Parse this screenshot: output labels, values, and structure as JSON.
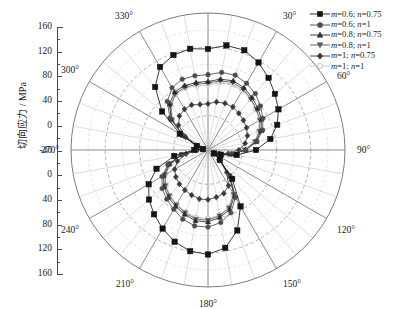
{
  "axis": {
    "y_title": "切向应力 / MPa",
    "y_ticks": [
      "160",
      "120",
      "80",
      "40",
      "0",
      "-40",
      "0",
      "40",
      "80",
      "120",
      "160"
    ]
  },
  "angles": {
    "a0": "0°",
    "a30": "30°",
    "a60": "60°",
    "a90": "90°",
    "a120": "120°",
    "a150": "150°",
    "a180": "180°",
    "a210": "210°",
    "a240": "240°",
    "a270": "270°",
    "a300": "300°",
    "a330": "330°"
  },
  "legend": {
    "items": [
      {
        "label": "m=0.6; n=0.75",
        "marker": "square",
        "color": "#151515"
      },
      {
        "label": "m=0.6; n=1",
        "marker": "circle",
        "color": "#4c4c4c"
      },
      {
        "label": "m=0.8; n=0.75",
        "marker": "triangle-up",
        "color": "#2b2b2b"
      },
      {
        "label": "m=0.8; n=1",
        "marker": "triangle-down",
        "color": "#5a5a5a"
      },
      {
        "label": "m=1; n=0.75",
        "marker": "diamond",
        "color": "#3a3a3a"
      },
      {
        "label": "m=1; n=1",
        "marker": "circle-open",
        "color": "#c2c2c2"
      }
    ]
  },
  "chart_data": {
    "type": "line",
    "projection": "polar",
    "title": "",
    "xlabel": "角度 / (°)",
    "ylabel": "切向应力 / MPa",
    "rlim": [
      0,
      160
    ],
    "r_gridlines": [
      40,
      80,
      120,
      160
    ],
    "theta_gridlines": [
      0,
      30,
      60,
      90,
      120,
      150,
      180,
      210,
      240,
      270,
      300,
      330
    ],
    "theta_zero_location": "N",
    "theta_direction": "clockwise",
    "grid": true,
    "legend_position": "top-right",
    "theta": [
      0,
      10,
      20,
      30,
      40,
      50,
      60,
      70,
      80,
      90,
      100,
      110,
      120,
      130,
      140,
      150,
      160,
      170,
      180,
      190,
      200,
      210,
      220,
      230,
      240,
      250,
      260,
      270,
      280,
      290,
      300,
      310,
      320,
      330,
      340,
      350
    ],
    "series": [
      {
        "name": "m=0.6; n=0.75",
        "marker": "square",
        "color": "#151515",
        "values": [
          118,
          124,
          124,
          118,
          110,
          102,
          95,
          86,
          74,
          56,
          34,
          16,
          8,
          18,
          44,
          76,
          100,
          116,
          122,
          120,
          114,
          106,
          98,
          90,
          80,
          64,
          40,
          16,
          6,
          14,
          38,
          70,
          96,
          112,
          118,
          120
        ]
      },
      {
        "name": "m=0.6; n=1",
        "marker": "circle",
        "color": "#4c4c4c",
        "values": [
          88,
          92,
          93,
          90,
          86,
          80,
          74,
          68,
          58,
          44,
          28,
          14,
          8,
          18,
          40,
          64,
          78,
          86,
          90,
          90,
          86,
          80,
          75,
          70,
          62,
          50,
          32,
          14,
          6,
          14,
          34,
          58,
          74,
          84,
          88,
          88
        ]
      },
      {
        "name": "m=0.8; n=0.75",
        "marker": "triangle-up",
        "color": "#2b2b2b",
        "values": [
          80,
          84,
          86,
          84,
          80,
          76,
          72,
          66,
          57,
          44,
          28,
          14,
          8,
          18,
          40,
          62,
          74,
          80,
          84,
          84,
          80,
          76,
          72,
          67,
          60,
          48,
          32,
          14,
          6,
          14,
          34,
          56,
          70,
          78,
          80,
          80
        ]
      },
      {
        "name": "m=0.8; n=1",
        "marker": "triangle-down",
        "color": "#5a5a5a",
        "values": [
          78,
          82,
          84,
          82,
          78,
          74,
          70,
          64,
          56,
          43,
          27,
          14,
          8,
          18,
          39,
          60,
          72,
          78,
          82,
          82,
          78,
          74,
          70,
          65,
          58,
          47,
          31,
          14,
          6,
          14,
          33,
          55,
          68,
          76,
          78,
          78
        ]
      },
      {
        "name": "m=1; n=0.75",
        "marker": "diamond",
        "color": "#3a3a3a",
        "values": [
          54,
          57,
          58,
          58,
          56,
          54,
          52,
          49,
          44,
          36,
          24,
          13,
          8,
          17,
          34,
          48,
          54,
          56,
          58,
          58,
          56,
          54,
          52,
          49,
          45,
          38,
          26,
          13,
          6,
          13,
          30,
          45,
          52,
          55,
          56,
          54
        ]
      },
      {
        "name": "m=1; n=1",
        "marker": "circle-open",
        "color": "#c2c2c2",
        "values": [
          76,
          80,
          82,
          80,
          77,
          73,
          69,
          63,
          55,
          42,
          27,
          14,
          8,
          18,
          39,
          59,
          71,
          77,
          80,
          80,
          77,
          73,
          69,
          64,
          57,
          46,
          30,
          14,
          6,
          14,
          33,
          54,
          67,
          75,
          77,
          76
        ]
      }
    ]
  }
}
